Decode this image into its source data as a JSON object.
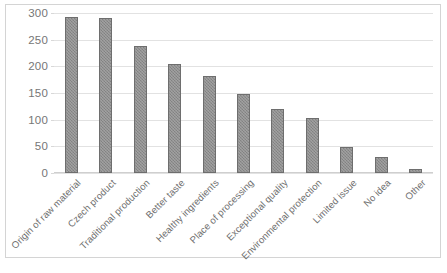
{
  "chart_data": {
    "type": "bar",
    "title": "",
    "subtitle": "",
    "xlabel": "",
    "ylabel": "",
    "ylim": [
      0,
      300
    ],
    "yticks": [
      0,
      50,
      100,
      150,
      200,
      250,
      300
    ],
    "grid": true,
    "legend": false,
    "legend_position": "none",
    "bar_color": "#8c8c8c",
    "bar_border_color": "#6e6e6e",
    "gridline_color": "#e2e2e2",
    "axis_text_color": "#6f6f6f",
    "categories": [
      "Origin of raw material",
      "Czech product",
      "Traditional production",
      "Better taste",
      "Healthy ingredients",
      "Place of processing",
      "Exceptional quality",
      "Environmental protection",
      "Limited issue",
      "No idea",
      "Other"
    ],
    "values": [
      292,
      290,
      238,
      204,
      181,
      148,
      120,
      103,
      48,
      30,
      7
    ],
    "series": [
      {
        "name": "",
        "values": [
          292,
          290,
          238,
          204,
          181,
          148,
          120,
          103,
          48,
          30,
          7
        ]
      }
    ]
  }
}
